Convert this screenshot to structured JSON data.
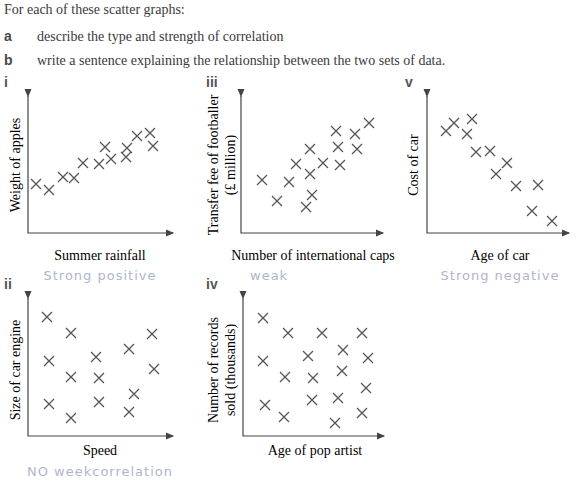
{
  "intro": "For each of these scatter graphs:",
  "questions": [
    {
      "letter": "a",
      "text": "describe the type and strength of correlation"
    },
    {
      "letter": "b",
      "text": "write a sentence explaining the relationship between the two sets of data."
    }
  ],
  "graphs": [
    {
      "id": "i",
      "xlabel": "Summer rainfall",
      "ylabel": "Weight of apples",
      "answer": "Strong positive"
    },
    {
      "id": "iii",
      "xlabel": "Number of international caps",
      "ylabel_line1": "Transfer fee of footballer",
      "ylabel_line2": "(£ million)",
      "answer": "weak"
    },
    {
      "id": "v",
      "xlabel": "Age of car",
      "ylabel": "Cost of car",
      "answer": "Strong negative"
    },
    {
      "id": "ii",
      "xlabel": "Speed",
      "ylabel": "Size of car engine",
      "answer": "NO weekcorrelation"
    },
    {
      "id": "iv",
      "xlabel": "Age of pop artist",
      "ylabel_line1": "Number of records",
      "ylabel_line2": "sold (thousands)",
      "answer": ""
    }
  ],
  "chart_data": [
    {
      "type": "scatter",
      "title": "i",
      "xlabel": "Summer rainfall",
      "ylabel": "Weight of apples",
      "points": [
        [
          36,
          184
        ],
        [
          49,
          190
        ],
        [
          63,
          177
        ],
        [
          74,
          178
        ],
        [
          83,
          163
        ],
        [
          99,
          164
        ],
        [
          105,
          147
        ],
        [
          111,
          159
        ],
        [
          126,
          157
        ],
        [
          127,
          148
        ],
        [
          137,
          136
        ],
        [
          150,
          133
        ],
        [
          153,
          146
        ]
      ]
    },
    {
      "type": "scatter",
      "title": "iii",
      "xlabel": "Number of international caps",
      "ylabel": "Transfer fee of footballer (£ million)",
      "points": [
        [
          262,
          180
        ],
        [
          277,
          201
        ],
        [
          289,
          182
        ],
        [
          296,
          164
        ],
        [
          310,
          149
        ],
        [
          310,
          174
        ],
        [
          312,
          195
        ],
        [
          306,
          207
        ],
        [
          323,
          163
        ],
        [
          336,
          131
        ],
        [
          338,
          147
        ],
        [
          340,
          165
        ],
        [
          355,
          134
        ],
        [
          357,
          149
        ],
        [
          369,
          123
        ]
      ]
    },
    {
      "type": "scatter",
      "title": "v",
      "xlabel": "Age of car",
      "ylabel": "Cost of car",
      "points": [
        [
          446,
          131
        ],
        [
          454,
          123
        ],
        [
          472,
          119
        ],
        [
          467,
          134
        ],
        [
          476,
          152
        ],
        [
          490,
          151
        ],
        [
          507,
          163
        ],
        [
          496,
          174
        ],
        [
          516,
          186
        ],
        [
          538,
          185
        ],
        [
          532,
          211
        ],
        [
          552,
          221
        ]
      ]
    },
    {
      "type": "scatter",
      "title": "ii",
      "xlabel": "Speed",
      "ylabel": "Size of car engine",
      "points": [
        [
          47,
          317
        ],
        [
          71,
          333
        ],
        [
          49,
          361
        ],
        [
          71,
          377
        ],
        [
          96,
          357
        ],
        [
          99,
          378
        ],
        [
          129,
          349
        ],
        [
          152,
          334
        ],
        [
          154,
          369
        ],
        [
          49,
          404
        ],
        [
          71,
          418
        ],
        [
          99,
          402
        ],
        [
          134,
          394
        ],
        [
          129,
          412
        ]
      ]
    },
    {
      "type": "scatter",
      "title": "iv",
      "xlabel": "Age of pop artist",
      "ylabel": "Number of records sold (thousands)",
      "points": [
        [
          263,
          318
        ],
        [
          288,
          333
        ],
        [
          322,
          333
        ],
        [
          362,
          333
        ],
        [
          343,
          350
        ],
        [
          308,
          356
        ],
        [
          263,
          361
        ],
        [
          368,
          358
        ],
        [
          285,
          377
        ],
        [
          313,
          378
        ],
        [
          342,
          371
        ],
        [
          366,
          388
        ],
        [
          265,
          405
        ],
        [
          284,
          417
        ],
        [
          312,
          400
        ],
        [
          338,
          398
        ],
        [
          335,
          423
        ],
        [
          362,
          413
        ]
      ]
    }
  ]
}
